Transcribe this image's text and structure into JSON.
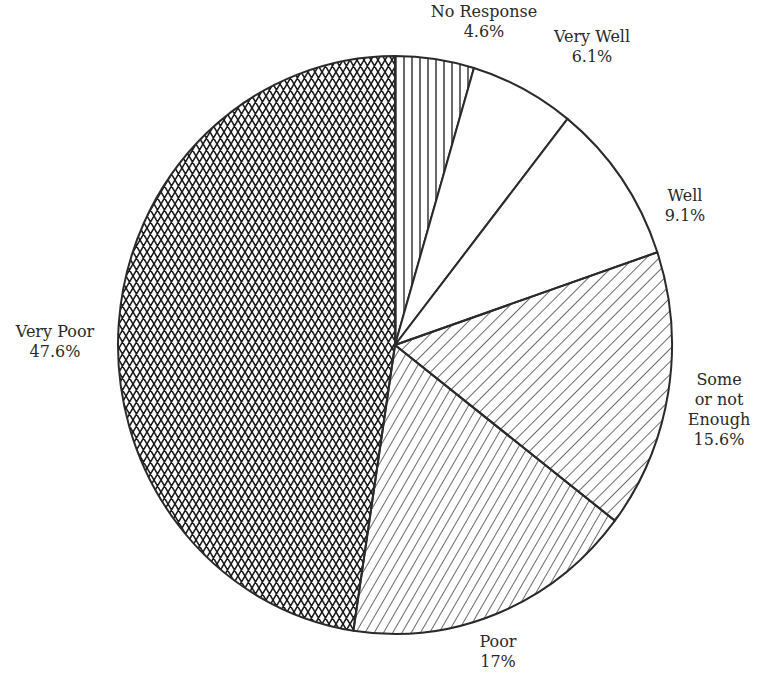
{
  "chart_data": {
    "type": "pie",
    "title": "",
    "start_angle_deg": 0,
    "direction": "clockwise",
    "slices": [
      {
        "label": "No Response",
        "value": 4.6,
        "display": "4.6%",
        "pattern": "vertical-lines"
      },
      {
        "label": "Very Well",
        "value": 6.1,
        "display": "6.1%",
        "pattern": "none"
      },
      {
        "label": "Well",
        "value": 9.1,
        "display": "9.1%",
        "pattern": "none"
      },
      {
        "label": "Some or not Enough",
        "value": 15.6,
        "display": "15.6%",
        "pattern": "diagonal-down"
      },
      {
        "label": "Poor",
        "value": 17,
        "display": "17%",
        "pattern": "diagonal-up"
      },
      {
        "label": "Very Poor",
        "value": 47.6,
        "display": "47.6%",
        "pattern": "crosshatch"
      }
    ]
  },
  "labels": {
    "no_response": {
      "lines": [
        "No Response",
        "4.6%"
      ]
    },
    "very_well": {
      "lines": [
        "Very Well",
        "6.1%"
      ]
    },
    "well": {
      "lines": [
        "Well",
        "9.1%"
      ]
    },
    "some": {
      "lines": [
        "Some",
        "or not",
        "Enough",
        "15.6%"
      ]
    },
    "poor": {
      "lines": [
        "Poor",
        "17%"
      ]
    },
    "very_poor": {
      "lines": [
        "Very Poor",
        "47.6%"
      ]
    }
  },
  "colors": {
    "stroke": "#2a2a2a",
    "fill": "#ffffff",
    "text": "#2a2a2a"
  }
}
